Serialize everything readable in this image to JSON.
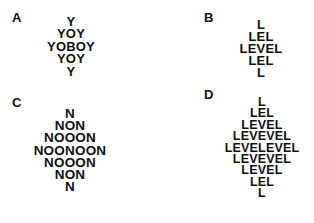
{
  "figure": {
    "panels": [
      {
        "label": "A",
        "rows": [
          "Y",
          "YOY",
          "YOBOY",
          "YOY",
          "Y"
        ]
      },
      {
        "label": "B",
        "rows": [
          "L",
          "LEL",
          "LEVEL",
          "LEL",
          "L"
        ]
      },
      {
        "label": "C",
        "rows": [
          "N",
          "NON",
          "NOOON",
          "NOONOON",
          "NOOON",
          "NON",
          "N"
        ]
      },
      {
        "label": "D",
        "rows": [
          "L",
          "LEL",
          "LEVEL",
          "LEVEVEL",
          "LEVELEVEL",
          "LEVEVEL",
          "LEVEL",
          "LEL",
          "L"
        ]
      }
    ]
  },
  "colors": {
    "text": "#111111",
    "background": "#ffffff"
  }
}
